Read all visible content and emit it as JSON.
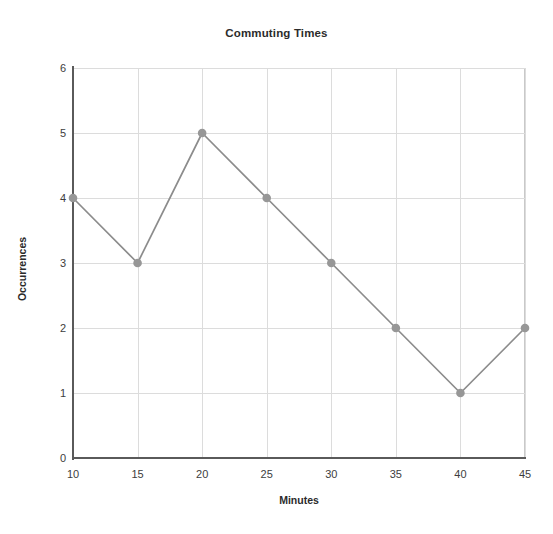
{
  "chart_data": {
    "type": "line",
    "title": "Commuting Times",
    "xlabel": "Minutes",
    "ylabel": "Occurrences",
    "x": [
      10,
      15,
      20,
      25,
      30,
      35,
      40,
      45
    ],
    "values": [
      4,
      3,
      5,
      4,
      3,
      2,
      1,
      2
    ],
    "series": [
      {
        "name": "Occurrences",
        "values": [
          4,
          3,
          5,
          4,
          3,
          2,
          1,
          2
        ]
      }
    ],
    "xlim": [
      10,
      45
    ],
    "ylim": [
      0,
      6
    ],
    "x_ticks": [
      10,
      15,
      20,
      25,
      30,
      35,
      40,
      45
    ],
    "y_ticks": [
      0,
      1,
      2,
      3,
      4,
      5,
      6
    ],
    "x_tick_labels": [
      "10",
      "15",
      "20",
      "25",
      "30",
      "35",
      "40",
      "45"
    ],
    "y_tick_labels": [
      "0",
      "1",
      "2",
      "3",
      "4",
      "5",
      "6"
    ],
    "grid": true,
    "legend": false,
    "legend_position": "none",
    "marker": "circle",
    "colors": {
      "line": "#8c8c8c",
      "marker": "#979797",
      "grid": "#dcdcdc",
      "axis": "#5a5a5a",
      "text": "#2b2b2b",
      "tick_text": "#3d3d3d",
      "background": "#ffffff",
      "frame": "#c9c9c9"
    }
  }
}
